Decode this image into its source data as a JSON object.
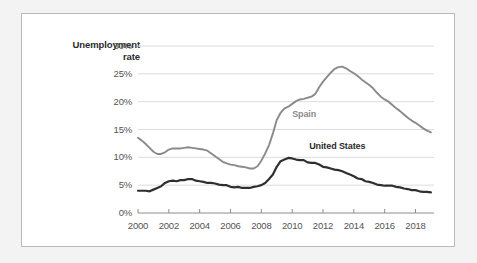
{
  "figure": {
    "background_color": "#f3f3f3",
    "panel_background": "#ffffff",
    "panel_border_color": "#b9b9b9"
  },
  "axis_title": {
    "line1": "Unemployment",
    "line2": "rate"
  },
  "chart_data": {
    "type": "line",
    "title": "",
    "xlabel": "",
    "ylabel": "Unemployment rate",
    "xlim": [
      2000,
      2019.2
    ],
    "ylim": [
      0,
      30
    ],
    "grid": true,
    "grid_axis": "y",
    "legend_position": "inline-annotation",
    "ytick_labels": [
      "0%",
      "5%",
      "10%",
      "15%",
      "20%",
      "25%",
      "30%"
    ],
    "ytick_values": [
      0,
      5,
      10,
      15,
      20,
      25,
      30
    ],
    "xtick_labels": [
      "2000",
      "2002",
      "2004",
      "2006",
      "2008",
      "2010",
      "2012",
      "2014",
      "2016",
      "2018"
    ],
    "xtick_values": [
      2000,
      2002,
      2004,
      2006,
      2008,
      2010,
      2012,
      2014,
      2016,
      2018
    ],
    "series": [
      {
        "name": "Spain",
        "color": "#8a8a8a",
        "label_x": 2010.0,
        "label_y": 17.6,
        "x": [
          2000.0,
          2000.25,
          2000.5,
          2000.75,
          2001.0,
          2001.25,
          2001.5,
          2001.75,
          2002.0,
          2002.25,
          2002.5,
          2002.75,
          2003.0,
          2003.25,
          2003.5,
          2003.75,
          2004.0,
          2004.25,
          2004.5,
          2004.75,
          2005.0,
          2005.25,
          2005.5,
          2005.75,
          2006.0,
          2006.25,
          2006.5,
          2006.75,
          2007.0,
          2007.25,
          2007.5,
          2007.75,
          2008.0,
          2008.25,
          2008.5,
          2008.75,
          2009.0,
          2009.25,
          2009.5,
          2009.75,
          2010.0,
          2010.25,
          2010.5,
          2010.75,
          2011.0,
          2011.25,
          2011.5,
          2011.75,
          2012.0,
          2012.25,
          2012.5,
          2012.75,
          2013.0,
          2013.25,
          2013.5,
          2013.75,
          2014.0,
          2014.25,
          2014.5,
          2014.75,
          2015.0,
          2015.25,
          2015.5,
          2015.75,
          2016.0,
          2016.25,
          2016.5,
          2016.75,
          2017.0,
          2017.25,
          2017.5,
          2017.75,
          2018.0,
          2018.25,
          2018.5,
          2018.75,
          2019.0
        ],
        "values": [
          13.5,
          13.0,
          12.4,
          11.7,
          11.0,
          10.6,
          10.6,
          10.9,
          11.4,
          11.6,
          11.6,
          11.6,
          11.7,
          11.8,
          11.7,
          11.6,
          11.5,
          11.4,
          11.2,
          10.7,
          10.2,
          9.7,
          9.2,
          8.9,
          8.7,
          8.6,
          8.4,
          8.3,
          8.2,
          8.0,
          8.0,
          8.4,
          9.4,
          10.7,
          12.2,
          14.3,
          16.7,
          18.0,
          18.8,
          19.1,
          19.6,
          20.1,
          20.4,
          20.5,
          20.7,
          20.9,
          21.4,
          22.6,
          23.6,
          24.4,
          25.2,
          25.9,
          26.2,
          26.3,
          26.0,
          25.5,
          25.1,
          24.6,
          24.0,
          23.5,
          23.0,
          22.4,
          21.6,
          20.9,
          20.4,
          20.0,
          19.4,
          18.8,
          18.3,
          17.7,
          17.1,
          16.6,
          16.2,
          15.7,
          15.2,
          14.8,
          14.5
        ]
      },
      {
        "name": "United States",
        "color": "#2f2f2f",
        "label_x": 2011.1,
        "label_y": 11.9,
        "x": [
          2000.0,
          2000.25,
          2000.5,
          2000.75,
          2001.0,
          2001.25,
          2001.5,
          2001.75,
          2002.0,
          2002.25,
          2002.5,
          2002.75,
          2003.0,
          2003.25,
          2003.5,
          2003.75,
          2004.0,
          2004.25,
          2004.5,
          2004.75,
          2005.0,
          2005.25,
          2005.5,
          2005.75,
          2006.0,
          2006.25,
          2006.5,
          2006.75,
          2007.0,
          2007.25,
          2007.5,
          2007.75,
          2008.0,
          2008.25,
          2008.5,
          2008.75,
          2009.0,
          2009.25,
          2009.5,
          2009.75,
          2010.0,
          2010.25,
          2010.5,
          2010.75,
          2011.0,
          2011.25,
          2011.5,
          2011.75,
          2012.0,
          2012.25,
          2012.5,
          2012.75,
          2013.0,
          2013.25,
          2013.5,
          2013.75,
          2014.0,
          2014.25,
          2014.5,
          2014.75,
          2015.0,
          2015.25,
          2015.5,
          2015.75,
          2016.0,
          2016.25,
          2016.5,
          2016.75,
          2017.0,
          2017.25,
          2017.5,
          2017.75,
          2018.0,
          2018.25,
          2018.5,
          2018.75,
          2019.0
        ],
        "values": [
          4.0,
          4.0,
          4.0,
          3.9,
          4.2,
          4.5,
          4.8,
          5.4,
          5.7,
          5.8,
          5.7,
          5.9,
          5.9,
          6.1,
          6.1,
          5.8,
          5.7,
          5.6,
          5.4,
          5.4,
          5.3,
          5.1,
          5.0,
          5.0,
          4.7,
          4.6,
          4.7,
          4.5,
          4.5,
          4.5,
          4.7,
          4.8,
          5.0,
          5.4,
          6.1,
          6.9,
          8.3,
          9.3,
          9.6,
          9.9,
          9.8,
          9.6,
          9.5,
          9.5,
          9.1,
          9.0,
          9.0,
          8.7,
          8.3,
          8.2,
          8.0,
          7.8,
          7.7,
          7.5,
          7.2,
          6.9,
          6.6,
          6.2,
          6.1,
          5.7,
          5.6,
          5.4,
          5.1,
          5.0,
          4.9,
          4.9,
          4.9,
          4.7,
          4.6,
          4.4,
          4.3,
          4.1,
          4.1,
          3.9,
          3.8,
          3.8,
          3.7
        ]
      }
    ]
  }
}
